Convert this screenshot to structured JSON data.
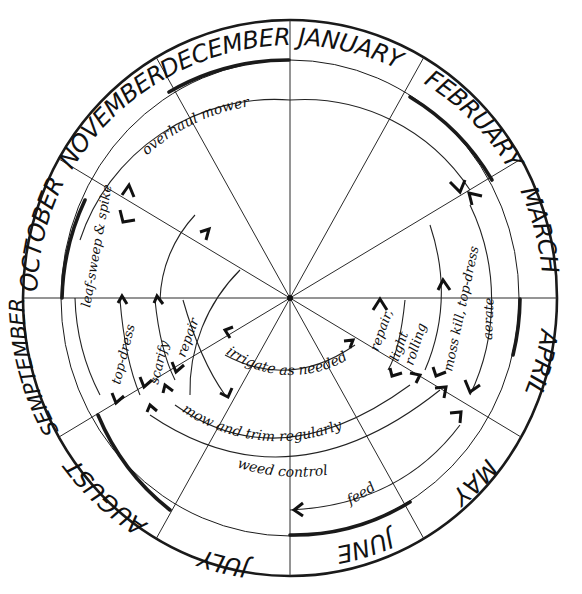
{
  "diagram": {
    "months": [
      "JANUARY",
      "FEBRUARY",
      "MARCH",
      "APRIL",
      "MAY",
      "JUNE",
      "JULY",
      "AUGUST",
      "SEMPTEMBER",
      "OCTOBER",
      "NOVEMBER",
      "DECEMBER"
    ],
    "tasks": {
      "overhaul_mower": "overhaul mower",
      "leaf_sweep_spike": "leaf-sweep & spike",
      "top_dress_autumn": "top-dress",
      "scarify": "scarify",
      "repair_autumn": "repair",
      "irrigate": "irrigate as needed",
      "mow_trim": "mow and trim regularly",
      "weed_control": "weed control",
      "feed": "feed",
      "repair_spring": "repair,",
      "light_rolling_1": "light",
      "light_rolling_2": "rolling",
      "moss_kill_top_dress": "moss kill, top-dress",
      "aerate": "aerate"
    },
    "colors": {
      "ink": "#111111",
      "background": "#ffffff"
    }
  }
}
